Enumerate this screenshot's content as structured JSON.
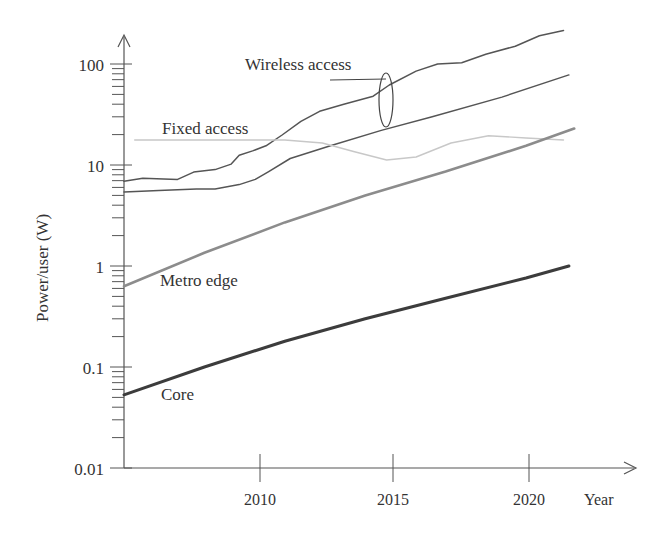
{
  "chart_data": {
    "type": "line",
    "title": "",
    "xlabel": "Year",
    "ylabel": "Power/user (W)",
    "yscale": "log",
    "ylim": [
      0.01,
      200
    ],
    "xlim": [
      2005,
      2023
    ],
    "x_ticks": [
      2010,
      2015,
      2020
    ],
    "y_ticks": [
      0.01,
      0.1,
      1,
      10,
      100
    ],
    "y_tick_labels": [
      "0.01",
      "0.1",
      "1",
      "10",
      "100"
    ],
    "grid": false,
    "legend": "inline labels",
    "annotations": [
      {
        "text": "Wireless access",
        "target": "wireless band (two curves grouped by ellipse)"
      },
      {
        "text": "Fixed access"
      },
      {
        "text": "Metro edge"
      },
      {
        "text": "Core"
      }
    ],
    "series": [
      {
        "name": "Wireless access (upper)",
        "color": "#555555",
        "x": [
          2005,
          2005.7,
          2007,
          2007.6,
          2008.4,
          2009,
          2009.3,
          2009.8,
          2010.3,
          2010.9,
          2011.6,
          2012.3,
          2013.2,
          2014.3,
          2014.9,
          2015.9,
          2016.7,
          2017.6,
          2018.5,
          2019.6,
          2020.5,
          2021.4
        ],
        "values": [
          6.9,
          7.4,
          7.2,
          8.5,
          9.0,
          10.2,
          12.5,
          13.8,
          15.5,
          19.8,
          27,
          34,
          40,
          48,
          62,
          85,
          100,
          103,
          125,
          150,
          190,
          215
        ]
      },
      {
        "name": "Wireless access (lower)",
        "color": "#555555",
        "x": [
          2005,
          2006.3,
          2007.7,
          2008.4,
          2009.3,
          2009.9,
          2010.4,
          2011.2,
          2012.7,
          2014.6,
          2016.5,
          2019.1,
          2021.6
        ],
        "values": [
          5.4,
          5.6,
          5.8,
          5.8,
          6.4,
          7.2,
          8.6,
          11.6,
          15.5,
          22,
          30,
          47,
          78
        ]
      },
      {
        "name": "Fixed access",
        "color": "#c8c8c8",
        "x": [
          2005.4,
          2008,
          2011,
          2012.4,
          2013.6,
          2014.8,
          2015.9,
          2017.2,
          2018.6,
          2020,
          2021.4
        ],
        "values": [
          17.7,
          17.7,
          17.7,
          16.5,
          13.5,
          11.2,
          12,
          16.5,
          19.5,
          18.5,
          17.7
        ]
      },
      {
        "name": "Metro edge",
        "color": "#8c8c8c",
        "x": [
          2005,
          2008,
          2011,
          2014,
          2017,
          2020,
          2021.8
        ],
        "values": [
          0.63,
          1.35,
          2.7,
          5.0,
          8.6,
          15.5,
          23
        ]
      },
      {
        "name": "Core",
        "color": "#3c3c3c",
        "x": [
          2005,
          2008,
          2011,
          2014,
          2017,
          2020,
          2021.6
        ],
        "values": [
          0.053,
          0.1,
          0.18,
          0.3,
          0.48,
          0.76,
          1.0
        ]
      }
    ]
  },
  "labels": {
    "ylabel": "Power/user (W)",
    "xlabel": "Year",
    "y_ticks": [
      "100",
      "10",
      "1",
      "0.1",
      "0.01"
    ],
    "x_ticks": [
      "2010",
      "2015",
      "2020"
    ],
    "wireless": "Wireless access",
    "fixed": "Fixed access",
    "metro": "Metro edge",
    "core": "Core"
  }
}
